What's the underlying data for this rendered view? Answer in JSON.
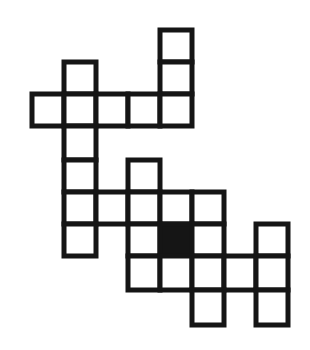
{
  "figure": {
    "shape_kind": "grid-of-squares",
    "colors": {
      "background": "#ffffff",
      "stroke": "#151515",
      "cell_fill": "#ffffff",
      "highlight_fill": "#151515"
    },
    "geometry": {
      "origin_x": 32,
      "origin_y": 30,
      "cell_width": 32,
      "cell_height": 32,
      "stroke_width": 5,
      "columns": 9,
      "rows": 9,
      "column_x": [
        32,
        64,
        96,
        128,
        160,
        192,
        224,
        256,
        288
      ],
      "row_y": [
        30,
        62,
        94,
        126,
        160,
        192,
        224,
        256,
        290,
        325
      ]
    },
    "counts": {
      "total_cells": 28,
      "white_cells": 27,
      "black_cells": 1
    },
    "highlight": {
      "label": "shaded-cell",
      "column": 4,
      "row": 6,
      "x": 160,
      "y": 224,
      "width": 32,
      "height": 32
    },
    "cells": [
      {
        "name": "cell-r0-c4",
        "col": 4,
        "row": 0,
        "x": 160,
        "y": 30,
        "w": 32,
        "h": 32,
        "filled": false
      },
      {
        "name": "cell-r1-c1",
        "col": 1,
        "row": 1,
        "x": 64,
        "y": 62,
        "w": 32,
        "h": 32,
        "filled": false
      },
      {
        "name": "cell-r1-c4",
        "col": 4,
        "row": 1,
        "x": 160,
        "y": 62,
        "w": 32,
        "h": 32,
        "filled": false
      },
      {
        "name": "cell-r2-c0",
        "col": 0,
        "row": 2,
        "x": 32,
        "y": 94,
        "w": 32,
        "h": 32,
        "filled": false
      },
      {
        "name": "cell-r2-c1",
        "col": 1,
        "row": 2,
        "x": 64,
        "y": 94,
        "w": 32,
        "h": 32,
        "filled": false
      },
      {
        "name": "cell-r2-c2",
        "col": 2,
        "row": 2,
        "x": 96,
        "y": 94,
        "w": 32,
        "h": 32,
        "filled": false
      },
      {
        "name": "cell-r2-c3",
        "col": 3,
        "row": 2,
        "x": 128,
        "y": 94,
        "w": 32,
        "h": 32,
        "filled": false
      },
      {
        "name": "cell-r2-c4",
        "col": 4,
        "row": 2,
        "x": 160,
        "y": 94,
        "w": 32,
        "h": 32,
        "filled": false
      },
      {
        "name": "cell-r3-c1",
        "col": 1,
        "row": 3,
        "x": 64,
        "y": 126,
        "w": 32,
        "h": 34,
        "filled": false
      },
      {
        "name": "cell-r4-c1",
        "col": 1,
        "row": 4,
        "x": 64,
        "y": 160,
        "w": 32,
        "h": 32,
        "filled": false
      },
      {
        "name": "cell-r4-c3",
        "col": 3,
        "row": 4,
        "x": 128,
        "y": 160,
        "w": 32,
        "h": 32,
        "filled": false
      },
      {
        "name": "cell-r5-c1",
        "col": 1,
        "row": 5,
        "x": 64,
        "y": 192,
        "w": 32,
        "h": 32,
        "filled": false
      },
      {
        "name": "cell-r5-c2",
        "col": 2,
        "row": 5,
        "x": 96,
        "y": 192,
        "w": 32,
        "h": 32,
        "filled": false
      },
      {
        "name": "cell-r5-c3",
        "col": 3,
        "row": 5,
        "x": 128,
        "y": 192,
        "w": 32,
        "h": 32,
        "filled": false
      },
      {
        "name": "cell-r5-c4",
        "col": 4,
        "row": 5,
        "x": 160,
        "y": 192,
        "w": 32,
        "h": 32,
        "filled": false
      },
      {
        "name": "cell-r5-c5",
        "col": 5,
        "row": 5,
        "x": 192,
        "y": 192,
        "w": 32,
        "h": 32,
        "filled": false
      },
      {
        "name": "cell-r6-c1",
        "col": 1,
        "row": 6,
        "x": 64,
        "y": 224,
        "w": 32,
        "h": 32,
        "filled": false
      },
      {
        "name": "cell-r6-c3",
        "col": 3,
        "row": 6,
        "x": 128,
        "y": 224,
        "w": 32,
        "h": 32,
        "filled": false
      },
      {
        "name": "cell-r6-c4",
        "col": 4,
        "row": 6,
        "x": 160,
        "y": 224,
        "w": 32,
        "h": 32,
        "filled": true
      },
      {
        "name": "cell-r6-c5",
        "col": 5,
        "row": 6,
        "x": 192,
        "y": 224,
        "w": 32,
        "h": 32,
        "filled": false
      },
      {
        "name": "cell-r6-c7",
        "col": 7,
        "row": 6,
        "x": 256,
        "y": 224,
        "w": 32,
        "h": 32,
        "filled": false
      },
      {
        "name": "cell-r7-c3",
        "col": 3,
        "row": 7,
        "x": 128,
        "y": 256,
        "w": 32,
        "h": 34,
        "filled": false
      },
      {
        "name": "cell-r7-c4",
        "col": 4,
        "row": 7,
        "x": 160,
        "y": 256,
        "w": 32,
        "h": 34,
        "filled": false
      },
      {
        "name": "cell-r7-c5",
        "col": 5,
        "row": 7,
        "x": 192,
        "y": 256,
        "w": 32,
        "h": 34,
        "filled": false
      },
      {
        "name": "cell-r7-c6",
        "col": 6,
        "row": 7,
        "x": 224,
        "y": 256,
        "w": 32,
        "h": 34,
        "filled": false
      },
      {
        "name": "cell-r7-c7",
        "col": 7,
        "row": 7,
        "x": 256,
        "y": 256,
        "w": 32,
        "h": 34,
        "filled": false
      },
      {
        "name": "cell-r8-c5",
        "col": 5,
        "row": 8,
        "x": 192,
        "y": 290,
        "w": 32,
        "h": 35,
        "filled": false
      },
      {
        "name": "cell-r8-c7",
        "col": 7,
        "row": 8,
        "x": 256,
        "y": 290,
        "w": 32,
        "h": 35,
        "filled": false
      }
    ]
  }
}
